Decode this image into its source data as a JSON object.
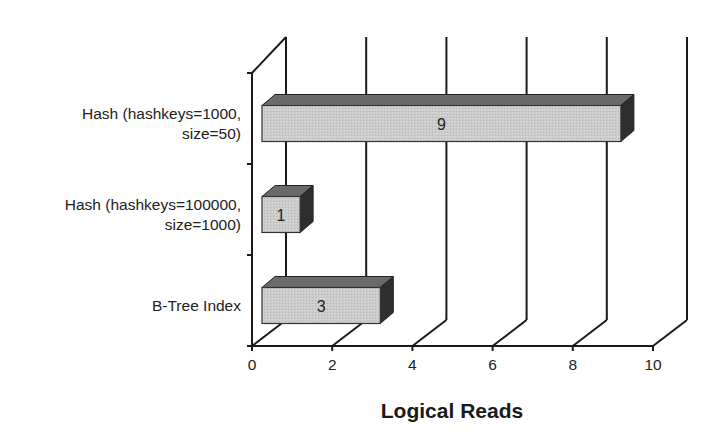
{
  "chart_data": {
    "type": "bar",
    "orientation": "horizontal",
    "style": "3d",
    "title": "",
    "xlabel": "Logical Reads",
    "ylabel": "",
    "xlim": [
      0,
      10
    ],
    "xticks": [
      0,
      2,
      4,
      6,
      8,
      10
    ],
    "grid": true,
    "legend": null,
    "categories": [
      "Hash (hashkeys=1000, size=50)",
      "Hash (hashkeys=100000, size=1000)",
      "B-Tree Index"
    ],
    "category_lines": [
      [
        "Hash  (hashkeys=1000,",
        "size=50)"
      ],
      [
        "Hash  (hashkeys=100000,",
        "size=1000)"
      ],
      [
        "B-Tree Index"
      ]
    ],
    "values": [
      9,
      1,
      3
    ],
    "data_labels": [
      "9",
      "1",
      "3"
    ],
    "colors": {
      "bar_front": "#c8c8c8",
      "bar_top": "#6a6a6a",
      "bar_side": "#2e2e2e",
      "axis": "#1a1a1a"
    }
  }
}
